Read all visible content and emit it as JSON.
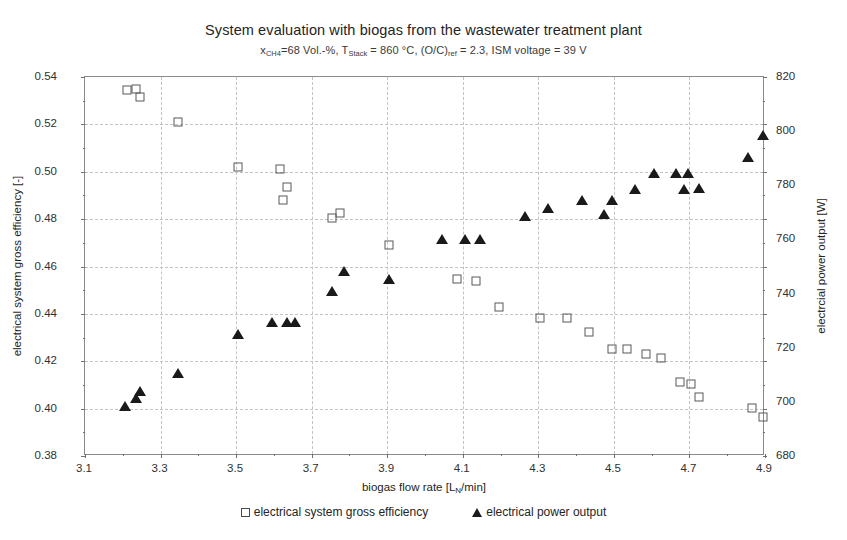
{
  "chart_data": {
    "type": "scatter",
    "title": "System evaluation with biogas from the wastewater treatment plant",
    "subtitle_parts": {
      "p1": "x",
      "sub1": "CH4",
      "p2": "=68 Vol.-%, T",
      "sub2": "Stack",
      "p3": " = 860 °C, (O/C)",
      "sub3": "ref",
      "p4": " = 2.3, ISM voltage = 39 V"
    },
    "subtitle": "xCH4=68 Vol.-%, TStack = 860 °C, (O/C)ref = 2.3, ISM voltage = 39 V",
    "xlabel_parts": {
      "p1": "biogas flow rate [L",
      "sub": "N",
      "p2": "/min]"
    },
    "xlabel": "biogas flow rate [LN/min]",
    "ylabel_left": "electrical system gross efficiency [-]",
    "ylabel_right": "electrcial power output [W]",
    "xlim": [
      3.1,
      4.9
    ],
    "ylim_left": [
      0.38,
      0.54
    ],
    "ylim_right": [
      680,
      820
    ],
    "xticks": [
      "3.1",
      "3.3",
      "3.5",
      "3.7",
      "3.9",
      "4.1",
      "4.3",
      "4.5",
      "4.7",
      "4.9"
    ],
    "xtick_values": [
      3.1,
      3.3,
      3.5,
      3.7,
      3.9,
      4.1,
      4.3,
      4.5,
      4.7,
      4.9
    ],
    "yticks_left": [
      "0.54",
      "0.52",
      "0.50",
      "0.48",
      "0.46",
      "0.44",
      "0.42",
      "0.40",
      "0.38"
    ],
    "ytick_left_values": [
      0.54,
      0.52,
      0.5,
      0.48,
      0.46,
      0.44,
      0.42,
      0.4,
      0.38
    ],
    "yticks_right": [
      "820",
      "800",
      "780",
      "760",
      "740",
      "720",
      "700",
      "680"
    ],
    "ytick_right_values": [
      820,
      800,
      780,
      760,
      740,
      720,
      700,
      680
    ],
    "grid": true,
    "legend_position": "bottom",
    "marker_color_efficiency": "#595959",
    "marker_color_power": "#1a1a1a",
    "series": [
      {
        "name": "electrical system gross efficiency",
        "axis": "left",
        "marker": "open-square",
        "points": [
          [
            3.21,
            0.5345
          ],
          [
            3.235,
            0.535
          ],
          [
            3.245,
            0.5315
          ],
          [
            3.345,
            0.5212
          ],
          [
            3.505,
            0.5022
          ],
          [
            3.615,
            0.501
          ],
          [
            3.635,
            0.4935
          ],
          [
            3.625,
            0.488
          ],
          [
            3.755,
            0.4805
          ],
          [
            3.775,
            0.4825
          ],
          [
            3.905,
            0.469
          ],
          [
            4.085,
            0.4548
          ],
          [
            4.135,
            0.454
          ],
          [
            4.195,
            0.4428
          ],
          [
            4.305,
            0.4382
          ],
          [
            4.375,
            0.4382
          ],
          [
            4.435,
            0.4325
          ],
          [
            4.495,
            0.4252
          ],
          [
            4.535,
            0.425
          ],
          [
            4.585,
            0.4232
          ],
          [
            4.625,
            0.4212
          ],
          [
            4.675,
            0.4112
          ],
          [
            4.705,
            0.4105
          ],
          [
            4.725,
            0.4048
          ],
          [
            4.865,
            0.4002
          ],
          [
            4.895,
            0.3965
          ]
        ]
      },
      {
        "name": "electrical power output",
        "axis": "right",
        "marker": "filled-triangle",
        "points": [
          [
            3.205,
            698.5
          ],
          [
            3.245,
            704.0
          ],
          [
            3.235,
            701.5
          ],
          [
            3.345,
            710.5
          ],
          [
            3.505,
            725.0
          ],
          [
            3.595,
            729.5
          ],
          [
            3.635,
            729.5
          ],
          [
            3.655,
            729.5
          ],
          [
            3.755,
            741.0
          ],
          [
            3.785,
            748.5
          ],
          [
            3.905,
            745.5
          ],
          [
            4.045,
            760.0
          ],
          [
            4.105,
            760.0
          ],
          [
            4.145,
            760.0
          ],
          [
            4.265,
            768.5
          ],
          [
            4.325,
            771.5
          ],
          [
            4.415,
            774.5
          ],
          [
            4.495,
            774.5
          ],
          [
            4.475,
            769.5
          ],
          [
            4.555,
            778.5
          ],
          [
            4.605,
            784.5
          ],
          [
            4.665,
            784.5
          ],
          [
            4.695,
            784.5
          ],
          [
            4.685,
            778.5
          ],
          [
            4.725,
            779.0
          ],
          [
            4.855,
            790.5
          ],
          [
            4.895,
            798.5
          ]
        ]
      }
    ]
  },
  "legend": [
    {
      "label": "electrical system gross efficiency",
      "marker": "open-square"
    },
    {
      "label": "electrical power output",
      "marker": "filled-triangle"
    }
  ]
}
